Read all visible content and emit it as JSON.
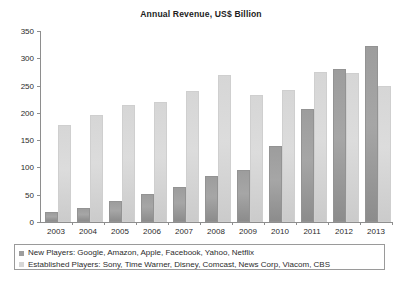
{
  "chart_data": {
    "type": "bar",
    "title": "Annual Revenue, US$ Billion",
    "xlabel": "",
    "ylabel": "",
    "ylim": [
      0,
      350
    ],
    "yticks": [
      0,
      50,
      100,
      150,
      200,
      250,
      300,
      350
    ],
    "ytick_labels": [
      "0",
      "50",
      "100",
      "150",
      "200",
      "250",
      "300",
      "350"
    ],
    "grid": false,
    "legend_position": "bottom",
    "categories": [
      "2003",
      "2004",
      "2005",
      "2006",
      "2007",
      "2008",
      "2009",
      "2010",
      "2011",
      "2012",
      "2013"
    ],
    "series": [
      {
        "name": "New Players: Google, Amazon, Apple, Facebook, Yahoo, Netflix",
        "short_name": "New Players",
        "color": "#9d9d9d",
        "values": [
          14,
          22,
          35,
          48,
          61,
          80,
          91,
          135,
          203,
          277,
          318
        ]
      },
      {
        "name": "Established Players: Sony, Time Warner, Disney, Comcast, News Corp, Viacom, CBS",
        "short_name": "Established Players",
        "color": "#d6d6d6",
        "values": [
          174,
          193,
          211,
          216,
          237,
          266,
          229,
          238,
          271,
          269,
          245
        ]
      }
    ]
  },
  "legend": {
    "items": [
      {
        "label": "New Players: Google, Amazon, Apple, Facebook, Yahoo, Netflix",
        "color": "#9d9d9d"
      },
      {
        "label": "Established Players: Sony, Time Warner, Disney, Comcast, News Corp, Viacom, CBS",
        "color": "#d6d6d6"
      }
    ]
  }
}
